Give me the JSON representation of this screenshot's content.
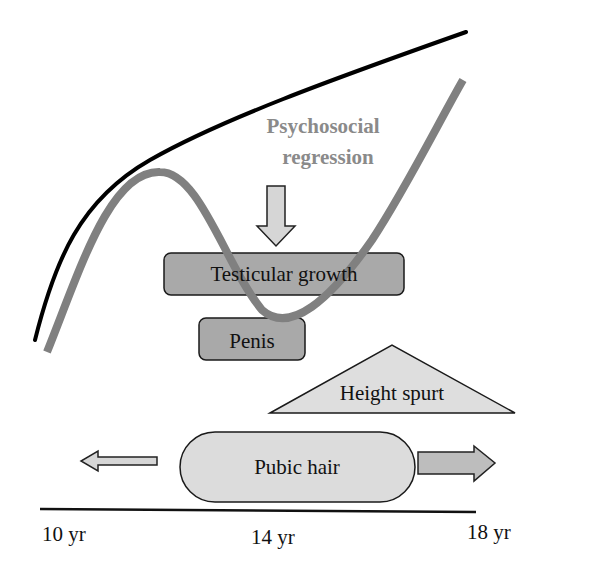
{
  "diagram": {
    "title_label": {
      "line1": "Psychosocial",
      "line2": "regression"
    },
    "boxes": {
      "testicular": "Testicular growth",
      "penis": "Penis",
      "height": "Height spurt",
      "pubic": "Pubic hair"
    },
    "axis": {
      "ticks": [
        "10 yr",
        "14 yr",
        "18 yr"
      ]
    },
    "colors": {
      "black_curve": "#000000",
      "gray_curve": "#808080",
      "label_gray": "#8a8a8a",
      "box_dark": "#a9a9a9",
      "box_light": "#dcdcdc",
      "arrow_fill": "#d0d0d0",
      "outline": "#1a1a1a"
    }
  }
}
